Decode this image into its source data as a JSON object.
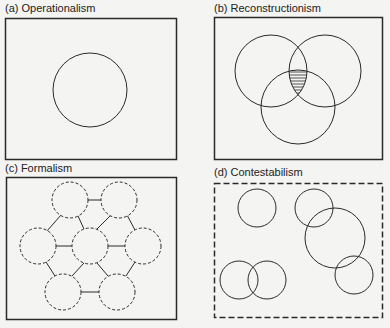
{
  "panels": [
    {
      "id": "a",
      "label": "(a)  Operationalism",
      "border": "solid"
    },
    {
      "id": "b",
      "label": "(b)  Reconstructionism",
      "border": "solid"
    },
    {
      "id": "c",
      "label": "(c)  Formalism",
      "border": "solid"
    },
    {
      "id": "d",
      "label": "(d)  Contestabilism",
      "border": "dashed"
    }
  ],
  "colors": {
    "ink": "#2a2a2a",
    "background": "#f4f4f2"
  }
}
